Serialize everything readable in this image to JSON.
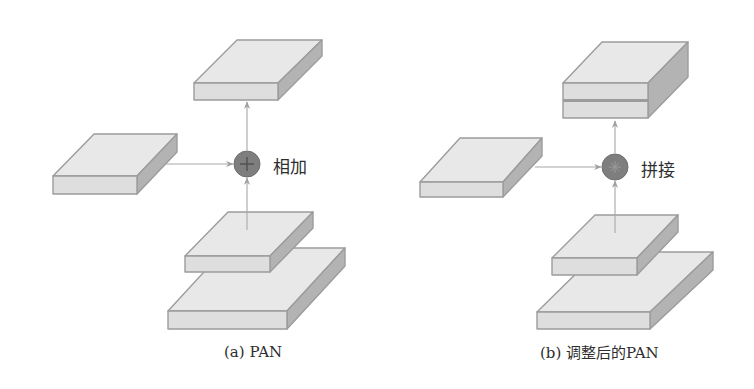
{
  "panels": [
    {
      "id": "a",
      "caption": "(a)  PAN",
      "operation_label": "相加",
      "operation_symbol": "plus-icon",
      "output_block": {
        "stacked_layers": 1
      },
      "lateral_block": {
        "stacked_layers": 1
      },
      "bottom_blocks": [
        {
          "role": "upper"
        },
        {
          "role": "lower-large"
        }
      ]
    },
    {
      "id": "b",
      "caption": "(b)  调整后的PAN",
      "operation_label": "拼接",
      "operation_symbol": "asterisk-icon",
      "output_block": {
        "stacked_layers": 2
      },
      "lateral_block": {
        "stacked_layers": 1
      },
      "bottom_blocks": [
        {
          "role": "upper"
        },
        {
          "role": "lower-large"
        }
      ]
    }
  ],
  "colors": {
    "top_face": "#e8e8e8",
    "front_face": "#dedede",
    "side_face": "#b3b3b3",
    "edge": "#9c9c9c",
    "operator_fill": "#7e7e7e",
    "arrow": "#a8a8a8",
    "text": "#2e2e2e"
  }
}
